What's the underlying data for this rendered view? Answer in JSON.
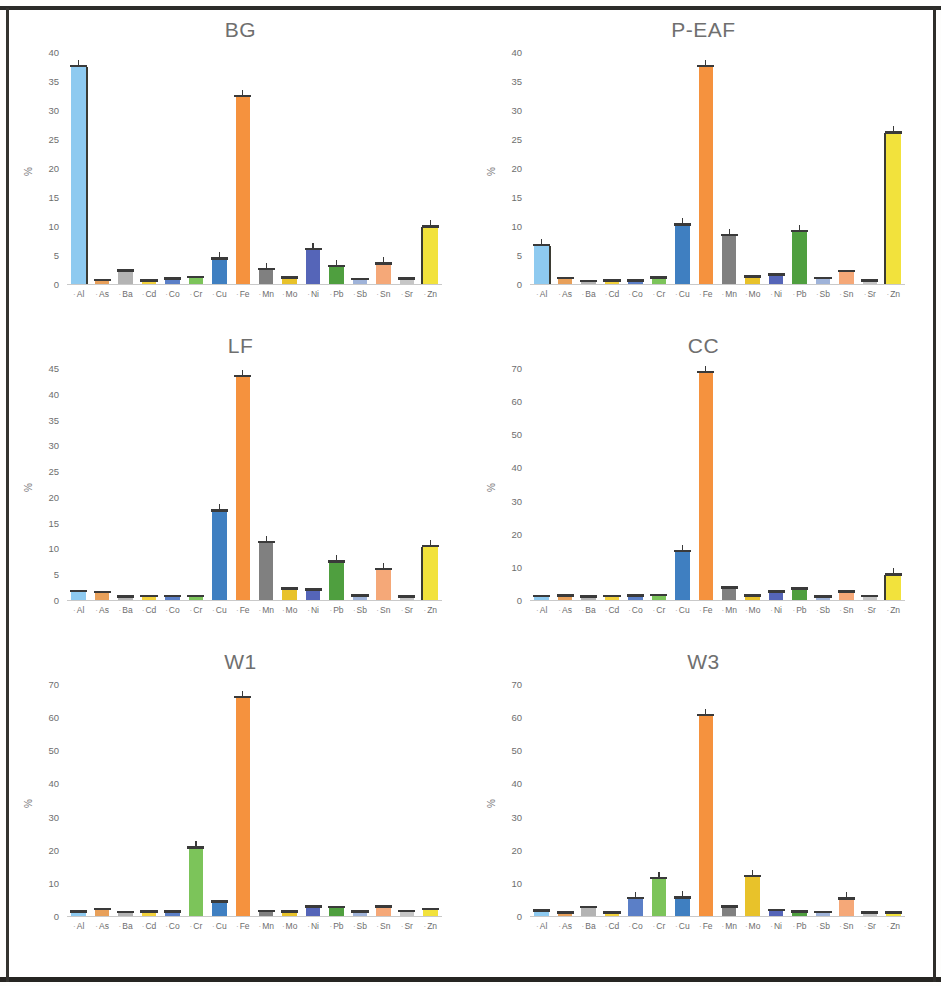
{
  "figure": {
    "ylabel": "%",
    "categories": [
      "Al",
      "As",
      "Ba",
      "Cd",
      "Co",
      "Cr",
      "Cu",
      "Fe",
      "Mn",
      "Mo",
      "Ni",
      "Pb",
      "Sb",
      "Sn",
      "Sr",
      "Zn"
    ],
    "category_colors": {
      "Al": "#8ecaf0",
      "As": "#e8a05a",
      "Ba": "#b4b4b4",
      "Cd": "#f2d13b",
      "Co": "#5b7fc7",
      "Cr": "#7cc45a",
      "Cu": "#3f7fc1",
      "Fe": "#f5923e",
      "Mn": "#808080",
      "Mo": "#e8c22a",
      "Ni": "#5565b8",
      "Pb": "#4f9f3f",
      "Sb": "#9fb3d9",
      "Sn": "#f5a878",
      "Sr": "#c6c6c6",
      "Zn": "#f2e23c"
    }
  },
  "chart_data": [
    {
      "type": "bar",
      "title": "BG",
      "xlabel": "",
      "ylabel": "%",
      "ylim": [
        0,
        40
      ],
      "yticks": [
        0,
        5,
        10,
        15,
        20,
        25,
        30,
        35,
        40
      ],
      "grid": false,
      "legend": "none",
      "categories": [
        "Al",
        "As",
        "Ba",
        "Cd",
        "Co",
        "Cr",
        "Cu",
        "Fe",
        "Mn",
        "Mo",
        "Ni",
        "Pb",
        "Sb",
        "Sn",
        "Sr",
        "Zn"
      ],
      "values": [
        37.5,
        0.6,
        2.2,
        0.5,
        0.8,
        1.1,
        4.3,
        32.3,
        2.5,
        1.0,
        5.9,
        3.0,
        0.7,
        3.4,
        0.8,
        9.8
      ]
    },
    {
      "type": "bar",
      "title": "P-EAF",
      "xlabel": "",
      "ylabel": "%",
      "ylim": [
        0,
        40
      ],
      "yticks": [
        0,
        5,
        10,
        15,
        20,
        25,
        30,
        35,
        40
      ],
      "grid": false,
      "legend": "none",
      "categories": [
        "Al",
        "As",
        "Ba",
        "Cd",
        "Co",
        "Cr",
        "Cu",
        "Fe",
        "Mn",
        "Mo",
        "Ni",
        "Pb",
        "Sb",
        "Sn",
        "Sr",
        "Zn"
      ],
      "values": [
        6.6,
        0.9,
        0.4,
        0.5,
        0.5,
        1.0,
        10.1,
        37.5,
        8.3,
        1.2,
        1.5,
        9.0,
        0.9,
        2.1,
        0.5,
        26.0
      ]
    },
    {
      "type": "bar",
      "title": "LF",
      "xlabel": "",
      "ylabel": "%",
      "ylim": [
        0,
        45
      ],
      "yticks": [
        0,
        5,
        10,
        15,
        20,
        25,
        30,
        35,
        40,
        45
      ],
      "grid": false,
      "legend": "none",
      "categories": [
        "Al",
        "As",
        "Ba",
        "Cd",
        "Co",
        "Cr",
        "Cu",
        "Fe",
        "Mn",
        "Mo",
        "Ni",
        "Pb",
        "Sb",
        "Sn",
        "Sr",
        "Zn"
      ],
      "values": [
        1.6,
        1.4,
        0.5,
        0.6,
        0.6,
        0.6,
        17.2,
        43.3,
        11.1,
        2.1,
        1.9,
        7.3,
        0.7,
        5.9,
        0.5,
        10.3
      ]
    },
    {
      "type": "bar",
      "title": "CC",
      "xlabel": "",
      "ylabel": "%",
      "ylim": [
        0,
        70
      ],
      "yticks": [
        0,
        10,
        20,
        30,
        40,
        50,
        60,
        70
      ],
      "grid": false,
      "legend": "none",
      "categories": [
        "Al",
        "As",
        "Ba",
        "Cd",
        "Co",
        "Cr",
        "Cu",
        "Fe",
        "Mn",
        "Mo",
        "Ni",
        "Pb",
        "Sb",
        "Sn",
        "Sr",
        "Zn"
      ],
      "values": [
        1.0,
        1.2,
        0.9,
        1.0,
        1.1,
        1.3,
        14.6,
        68.5,
        3.5,
        1.1,
        2.4,
        3.2,
        0.8,
        2.3,
        1.0,
        7.4
      ]
    },
    {
      "type": "bar",
      "title": "W1",
      "xlabel": "",
      "ylabel": "%",
      "ylim": [
        0,
        70
      ],
      "yticks": [
        0,
        10,
        20,
        30,
        40,
        50,
        60,
        70
      ],
      "grid": false,
      "legend": "none",
      "categories": [
        "Al",
        "As",
        "Ba",
        "Cd",
        "Co",
        "Cr",
        "Cu",
        "Fe",
        "Mn",
        "Mo",
        "Ni",
        "Pb",
        "Sb",
        "Sn",
        "Sr",
        "Zn"
      ],
      "values": [
        1.2,
        1.9,
        1.0,
        1.1,
        1.2,
        20.4,
        4.1,
        65.8,
        1.3,
        1.2,
        2.6,
        2.5,
        1.1,
        2.6,
        1.3,
        1.9
      ]
    },
    {
      "type": "bar",
      "title": "W3",
      "xlabel": "",
      "ylabel": "%",
      "ylim": [
        0,
        70
      ],
      "yticks": [
        0,
        10,
        20,
        30,
        40,
        50,
        60,
        70
      ],
      "grid": false,
      "legend": "none",
      "categories": [
        "Al",
        "As",
        "Ba",
        "Cd",
        "Co",
        "Cr",
        "Cu",
        "Fe",
        "Mn",
        "Mo",
        "Ni",
        "Pb",
        "Sb",
        "Sn",
        "Sr",
        "Zn"
      ],
      "values": [
        1.4,
        0.8,
        2.5,
        0.9,
        5.2,
        11.2,
        5.4,
        60.5,
        2.7,
        11.8,
        1.6,
        1.2,
        1.0,
        5.0,
        0.8,
        0.9
      ]
    }
  ],
  "panel_layout": [
    {
      "key": "BG",
      "col": 0,
      "row": 0
    },
    {
      "key": "P-EAF",
      "col": 1,
      "row": 0
    },
    {
      "key": "LF",
      "col": 0,
      "row": 1
    },
    {
      "key": "CC",
      "col": 1,
      "row": 1
    },
    {
      "key": "W1",
      "col": 0,
      "row": 2
    },
    {
      "key": "W3",
      "col": 1,
      "row": 2
    }
  ]
}
